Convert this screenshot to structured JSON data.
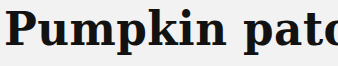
{
  "title": {
    "text": "Pumpkin patch"
  },
  "colors": {
    "background": "#f2f2f2",
    "text": "#121212"
  }
}
